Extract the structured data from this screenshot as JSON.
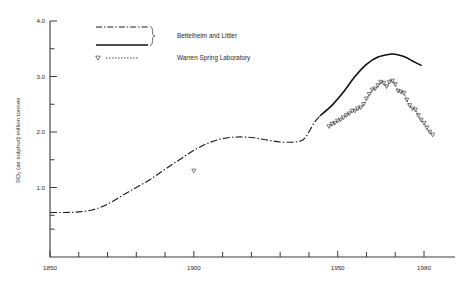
{
  "chart_data": {
    "type": "line",
    "title": "",
    "xlabel": "",
    "ylabel": "SO₂ (as sulphur) million tonnes",
    "xlim": [
      1850,
      1984
    ],
    "ylim": [
      0,
      4.0
    ],
    "grid": false,
    "legend_position": "top-left",
    "x_ticks_major": [
      1850,
      1900,
      1950,
      1980
    ],
    "x_tick_labels": [
      "1850",
      "1900",
      "1950",
      "1980"
    ],
    "x_ticks_minor": [
      1860,
      1870,
      1880,
      1890,
      1910,
      1920,
      1930,
      1940,
      1960,
      1970
    ],
    "y_ticks_major": [
      1.0,
      2.0,
      3.0,
      4.0
    ],
    "y_tick_labels": [
      "1.0",
      "2.0",
      "3.0",
      "4.0"
    ],
    "y_ticks_minor": [
      0.25,
      0.5,
      1.5,
      2.5,
      3.5
    ],
    "series": [
      {
        "name": "Bettelheim and Littler",
        "style": "dash-dot",
        "marker": "none",
        "color": "#1c1c1c",
        "points": [
          [
            1850,
            0.55
          ],
          [
            1855,
            0.55
          ],
          [
            1860,
            0.56
          ],
          [
            1865,
            0.6
          ],
          [
            1870,
            0.7
          ],
          [
            1875,
            0.85
          ],
          [
            1880,
            1.0
          ],
          [
            1885,
            1.15
          ],
          [
            1890,
            1.33
          ],
          [
            1895,
            1.5
          ],
          [
            1900,
            1.67
          ],
          [
            1905,
            1.8
          ],
          [
            1910,
            1.88
          ],
          [
            1915,
            1.91
          ],
          [
            1920,
            1.9
          ],
          [
            1925,
            1.86
          ],
          [
            1930,
            1.82
          ],
          [
            1935,
            1.82
          ],
          [
            1938,
            1.86
          ],
          [
            1940,
            2.0
          ],
          [
            1942,
            2.18
          ],
          [
            1944,
            2.3
          ]
        ]
      },
      {
        "name": "Bettelheim and Littler",
        "style": "solid",
        "marker": "none",
        "color": "#111111",
        "points": [
          [
            1944,
            2.3
          ],
          [
            1948,
            2.48
          ],
          [
            1952,
            2.72
          ],
          [
            1956,
            3.0
          ],
          [
            1960,
            3.22
          ],
          [
            1964,
            3.35
          ],
          [
            1968,
            3.4
          ],
          [
            1970,
            3.4
          ],
          [
            1973,
            3.36
          ],
          [
            1976,
            3.28
          ],
          [
            1979,
            3.2
          ]
        ]
      },
      {
        "name": "Warren Spring Laboratory",
        "style": "dotted",
        "marker": "triangle-down",
        "color": "#2b2b2b",
        "points": [
          [
            1900,
            1.3
          ],
          [
            1947,
            2.1
          ],
          [
            1948,
            2.14
          ],
          [
            1949,
            2.16
          ],
          [
            1950,
            2.2
          ],
          [
            1951,
            2.22
          ],
          [
            1952,
            2.26
          ],
          [
            1953,
            2.3
          ],
          [
            1954,
            2.33
          ],
          [
            1955,
            2.38
          ],
          [
            1956,
            2.38
          ],
          [
            1957,
            2.42
          ],
          [
            1958,
            2.44
          ],
          [
            1959,
            2.5
          ],
          [
            1960,
            2.6
          ],
          [
            1961,
            2.68
          ],
          [
            1962,
            2.76
          ],
          [
            1963,
            2.78
          ],
          [
            1964,
            2.84
          ],
          [
            1965,
            2.9
          ],
          [
            1966,
            2.88
          ],
          [
            1967,
            2.82
          ],
          [
            1968,
            2.9
          ],
          [
            1969,
            2.92
          ],
          [
            1970,
            2.86
          ],
          [
            1971,
            2.74
          ],
          [
            1972,
            2.72
          ],
          [
            1973,
            2.7
          ],
          [
            1974,
            2.58
          ],
          [
            1975,
            2.48
          ],
          [
            1976,
            2.42
          ],
          [
            1977,
            2.4
          ],
          [
            1978,
            2.3
          ],
          [
            1979,
            2.22
          ],
          [
            1980,
            2.16
          ],
          [
            1981,
            2.08
          ],
          [
            1982,
            2.0
          ],
          [
            1983,
            1.95
          ]
        ]
      }
    ],
    "legend": [
      {
        "label": "Bettelheim and Littler",
        "styles": [
          "dash-dot",
          "solid"
        ],
        "braced": true
      },
      {
        "label": "Warren Spring Laboratory",
        "styles": [
          "dotted"
        ],
        "marker": "triangle-down",
        "braced": false
      }
    ]
  }
}
